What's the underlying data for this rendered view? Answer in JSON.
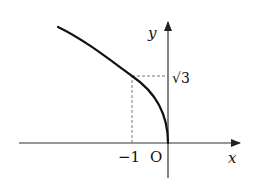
{
  "diagram": {
    "type": "function-graph",
    "axes": {
      "x_label": "x",
      "y_label": "y",
      "origin_label": "O"
    },
    "ticks": {
      "x_tick_label": "−1",
      "y_tick_label": "√3"
    },
    "curve": {
      "description": "curve through origin and point (-1, √3), increasing to the left"
    },
    "colors": {
      "curve": "#111111",
      "axes": "#333333",
      "dashed": "#777777"
    }
  }
}
